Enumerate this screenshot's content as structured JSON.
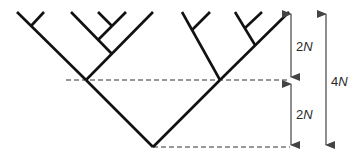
{
  "diagram": {
    "type": "coalescent-tree",
    "colors": {
      "branch": "#111111",
      "dashed": "#333333",
      "arrow": "#444444",
      "label": "#2a2a2a"
    },
    "labels": {
      "upper_interval": {
        "num": "2",
        "var": "N"
      },
      "lower_interval": {
        "num": "2",
        "var": "N"
      },
      "total_interval": {
        "num": "4",
        "var": "N"
      }
    },
    "tips_count": 11
  }
}
